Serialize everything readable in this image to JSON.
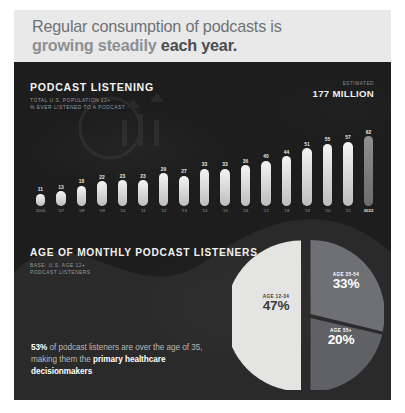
{
  "headline": {
    "line1": "Regular consumption of podcasts is",
    "line2_semi": "growing steadily ",
    "line2_strong": "each year",
    "line2_end": "."
  },
  "section1": {
    "title": "PODCAST LISTENING",
    "sub1": "TOTAL U.S. POPULATION 12+",
    "sub2": "% EVER LISTENED TO A PODCAST",
    "estimated_label": "ESTIMATED",
    "estimated_value": "177 MILLION"
  },
  "section2": {
    "title": "AGE OF MONTHLY PODCAST LISTENERS",
    "sub1": "BASE: U.S. AGE 12+",
    "sub2": "PODCAST LISTENERS"
  },
  "callout": {
    "b1": "53%",
    "t1": " of podcast listeners are over the age of 35, making them the ",
    "b2": "primary healthcare decisionmakers"
  },
  "colors": {
    "card_bg": "#1d1d1d",
    "band_bg": "#e9e9e9",
    "bar_light": "#e8e8e8",
    "bar_highlight": "#7a7c80",
    "pie_light": "#e4e4e2",
    "pie_mid": "#6e7074",
    "pie_dark": "#63656a"
  },
  "chart_data": [
    {
      "type": "bar",
      "title": "PODCAST LISTENING",
      "subtitle": "TOTAL U.S. POPULATION 12+ / % EVER LISTENED TO A PODCAST",
      "xlabel": "",
      "ylabel": "% ever listened to a podcast",
      "ylim": [
        0,
        62
      ],
      "grid": false,
      "legend": "none",
      "annotation": "ESTIMATED 177 MILLION",
      "categories": [
        "2006",
        "'07",
        "'08",
        "'09",
        "'10",
        "'11",
        "'12",
        "'13",
        "'14",
        "'15",
        "'16",
        "'17",
        "'18",
        "'19",
        "'20",
        "'21",
        "2022"
      ],
      "values": [
        11,
        13,
        18,
        22,
        23,
        23,
        29,
        27,
        33,
        33,
        36,
        40,
        44,
        51,
        55,
        57,
        62
      ],
      "highlight_index": 16
    },
    {
      "type": "pie",
      "title": "AGE OF MONTHLY PODCAST LISTENERS",
      "subtitle": "BASE: U.S. AGE 12+ / PODCAST LISTENERS",
      "legend": "inline-labels",
      "categories": [
        "AGE 12-34",
        "AGE 35-54",
        "AGE 55+"
      ],
      "values": [
        47,
        33,
        20
      ],
      "labels": [
        "47%",
        "33%",
        "20%"
      ]
    }
  ]
}
